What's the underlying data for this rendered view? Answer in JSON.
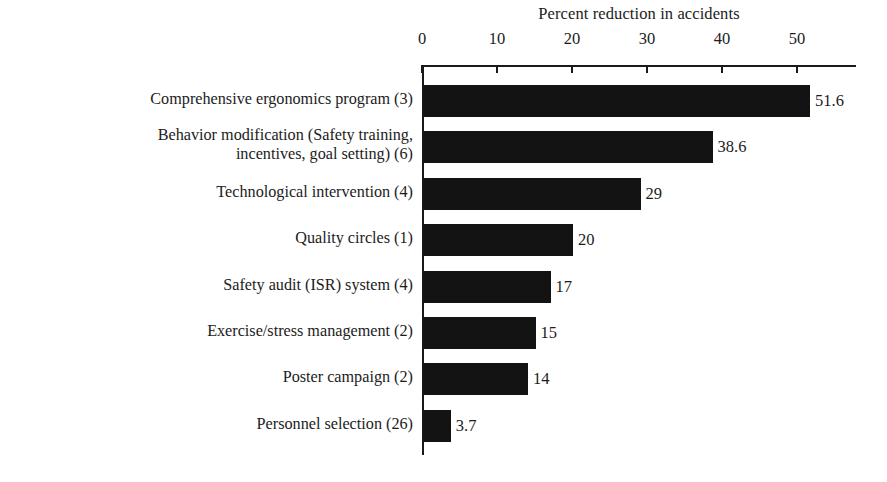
{
  "chart_data": {
    "type": "bar",
    "orientation": "horizontal",
    "title": "Percent reduction in accidents",
    "xlabel": "",
    "ylabel": "",
    "xlim": [
      0,
      57.8
    ],
    "xticks": [
      0,
      10,
      20,
      30,
      40,
      50
    ],
    "xtick_labels": [
      "0",
      "10",
      "20",
      "30",
      "40",
      "50"
    ],
    "grid": false,
    "legend": false,
    "axis_position": "top",
    "bar_color": "#131313",
    "categories": [
      "Comprehensive ergonomics program (3)",
      "Behavior modification (Safety training,\nincentives, goal setting) (6)",
      "Technological intervention (4)",
      "Quality circles (1)",
      "Safety audit (ISR) system (4)",
      "Exercise/stress management (2)",
      "Poster campaign (2)",
      "Personnel selection (26)"
    ],
    "values": [
      51.6,
      38.6,
      29,
      20,
      17,
      15,
      14,
      3.7
    ],
    "value_labels": [
      "51.6",
      "38.6",
      "29",
      "20",
      "17",
      "15",
      "14",
      "3.7"
    ]
  }
}
